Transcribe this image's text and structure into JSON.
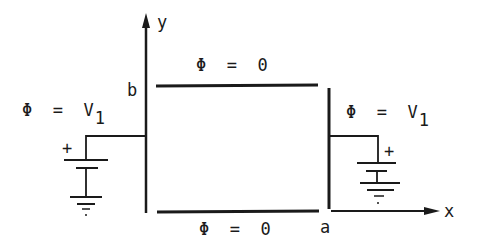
{
  "diagram": {
    "title": "",
    "axes": {
      "x_label": "x",
      "y_label": "y",
      "x_corner_label": "a",
      "y_corner_label": "b"
    },
    "boundaries": {
      "top": {
        "label": "Φ = 0",
        "potential": "0"
      },
      "bottom": {
        "label": "Φ = 0",
        "potential": "0"
      },
      "left": {
        "label_main": "Φ = V",
        "label_sub": "1",
        "potential": "V1"
      },
      "right": {
        "label_main": "Φ = V",
        "label_sub": "1",
        "potential": "V1"
      }
    },
    "batteries": {
      "left": {
        "polarity_label": "+"
      },
      "right": {
        "polarity_label": "+"
      }
    },
    "colors": {
      "ink": "#1a1a1a",
      "background": "#ffffff"
    }
  }
}
